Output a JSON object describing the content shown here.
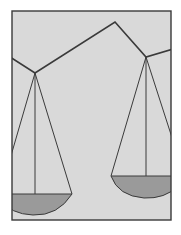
{
  "illustration": {
    "subject": "balance-scale-illustration",
    "colors": {
      "background": "#ffffff",
      "panel_fill": "#d9d9d9",
      "stroke": "#3a3a3a",
      "pan_fill": "#9a9a9a"
    }
  }
}
